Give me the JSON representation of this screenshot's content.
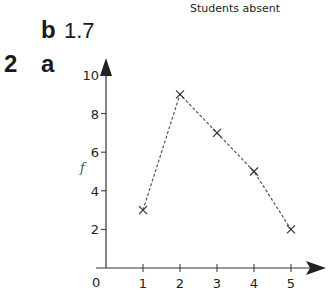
{
  "question": {
    "number": "2",
    "part_a": "a",
    "part_b": "b",
    "part_b_answer": "1.7"
  },
  "chart_data": {
    "type": "line",
    "title": "Students absent",
    "xlabel": "",
    "ylabel": "f",
    "x": [
      1,
      2,
      3,
      4,
      5
    ],
    "series": [
      {
        "name": "frequency",
        "values": [
          3,
          9,
          7,
          5,
          2
        ],
        "marker": "x",
        "line_style": "dashed"
      }
    ],
    "x_ticks": [
      "1",
      "2",
      "3",
      "4",
      "5"
    ],
    "y_ticks": [
      "2",
      "4",
      "6",
      "8",
      "10"
    ],
    "origin_label": "0",
    "xlim": [
      0,
      5.8
    ],
    "ylim": [
      0,
      10.8
    ],
    "grid": false,
    "legend": "none"
  }
}
